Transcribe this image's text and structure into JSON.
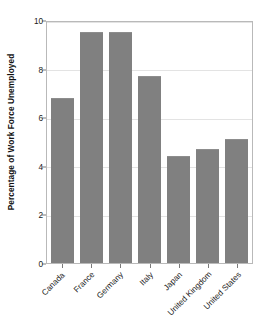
{
  "chart_data": {
    "type": "bar",
    "title": "",
    "xlabel": "",
    "ylabel": "Percentage of Work Force Unemployed",
    "categories": [
      "Canada",
      "France",
      "Germany",
      "Italy",
      "Japan",
      "United Kingdom",
      "United States"
    ],
    "values": [
      6.8,
      9.5,
      9.5,
      7.7,
      4.4,
      4.7,
      5.1
    ],
    "ylim": [
      0,
      10
    ],
    "yticks": [
      0,
      2,
      4,
      6,
      8,
      10
    ],
    "ytick_labels": [
      "0",
      "2",
      "4",
      "6",
      "8",
      "10"
    ],
    "grid": true,
    "legend": "none",
    "bar_color": "#808080",
    "frame_color": "#b9b9b9",
    "gridline_color": "#e3e3e3",
    "background_color": "#ffffff"
  }
}
